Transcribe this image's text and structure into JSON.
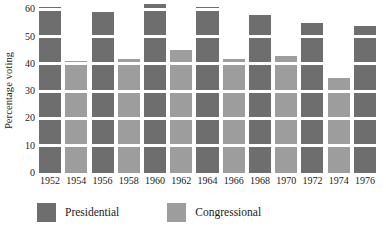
{
  "chart_data": {
    "type": "bar",
    "title": "",
    "subtitle": "",
    "xlabel": "",
    "ylabel": "Percentage voting",
    "ylim": [
      0,
      62
    ],
    "yticks": [
      0,
      10,
      20,
      30,
      40,
      50,
      60
    ],
    "ytick_labels": [
      "0",
      "10",
      "20",
      "30",
      "40",
      "50",
      "60"
    ],
    "grid": "horizontal-white-bands",
    "legend_position": "bottom-left",
    "categories": [
      "1952",
      "1954",
      "1956",
      "1958",
      "1960",
      "1962",
      "1964",
      "1966",
      "1968",
      "1970",
      "1972",
      "1974",
      "1976"
    ],
    "series": [
      {
        "name": "Presidential",
        "color": "#6e6e6e",
        "values": [
          61,
          null,
          59,
          null,
          62,
          null,
          61,
          null,
          58,
          null,
          55,
          null,
          54
        ]
      },
      {
        "name": "Congressional",
        "color": "#9d9d9d",
        "values": [
          null,
          41,
          null,
          42,
          null,
          45,
          null,
          42,
          null,
          43,
          null,
          35,
          null
        ]
      }
    ],
    "values": [
      61,
      41,
      59,
      42,
      62,
      45,
      61,
      42,
      58,
      43,
      55,
      35,
      54
    ],
    "bar_types": [
      "presidential",
      "congressional",
      "presidential",
      "congressional",
      "presidential",
      "congressional",
      "presidential",
      "congressional",
      "presidential",
      "congressional",
      "presidential",
      "congressional",
      "presidential"
    ],
    "legend": [
      {
        "label": "Presidential",
        "color": "#6e6e6e",
        "key": "presidential"
      },
      {
        "label": "Congressional",
        "color": "#9d9d9d",
        "key": "congressional"
      }
    ]
  }
}
